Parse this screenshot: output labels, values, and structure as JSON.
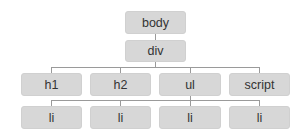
{
  "diagram": {
    "type": "dom-tree",
    "root": {
      "label": "body",
      "children": [
        {
          "label": "div",
          "children": [
            {
              "label": "h1"
            },
            {
              "label": "h2"
            },
            {
              "label": "ul"
            },
            {
              "label": "script"
            }
          ]
        }
      ]
    },
    "nodes": {
      "body": "body",
      "div": "div",
      "h1": "h1",
      "h2": "h2",
      "ul": "ul",
      "script": "script",
      "li1": "li",
      "li2": "li",
      "li3": "li",
      "li4": "li"
    },
    "colors": {
      "node_fill": "#d7d7d7",
      "connector": "#9a9a9a",
      "text": "#333333"
    }
  }
}
